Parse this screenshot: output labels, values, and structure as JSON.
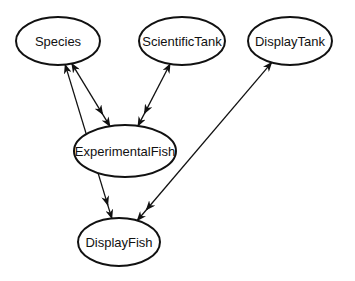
{
  "diagram": {
    "type": "entity-relationship graph",
    "nodes": [
      {
        "id": "species",
        "label": "Species",
        "cx": 58,
        "cy": 41,
        "rx": 42,
        "ry": 24
      },
      {
        "id": "scientific-tank",
        "label": "ScientificTank",
        "cx": 182,
        "cy": 41,
        "rx": 43,
        "ry": 24
      },
      {
        "id": "display-tank",
        "label": "DisplayTank",
        "cx": 290,
        "cy": 41,
        "rx": 42,
        "ry": 24
      },
      {
        "id": "experimental-fish",
        "label": "ExperimentalFish",
        "cx": 125,
        "cy": 151,
        "rx": 51,
        "ry": 26
      },
      {
        "id": "display-fish",
        "label": "DisplayFish",
        "cx": 119,
        "cy": 242,
        "rx": 41,
        "ry": 24
      }
    ],
    "edges": [
      {
        "from": "species",
        "to": "experimental-fish",
        "style": "bidirectional"
      },
      {
        "from": "scientific-tank",
        "to": "experimental-fish",
        "style": "bidirectional"
      },
      {
        "from": "species",
        "to": "display-fish",
        "style": "bidirectional"
      },
      {
        "from": "display-tank",
        "to": "display-fish",
        "style": "bidirectional"
      }
    ],
    "colors": {
      "stroke": "#111111",
      "fill": "#ffffff",
      "text": "#111111"
    }
  }
}
